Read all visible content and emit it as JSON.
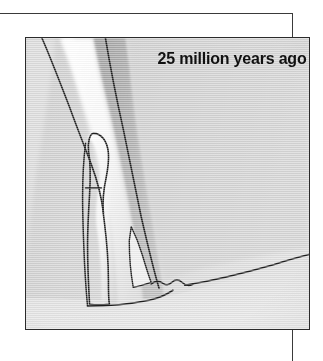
{
  "figure": {
    "caption": "25 million years ago",
    "frame": {
      "rule_color": "#3a3a3a",
      "panel_border_color": "#2b2b2b"
    }
  },
  "map": {
    "type": "shaded-relief-paleogeographic-map",
    "palette": {
      "background_plain": "#d6d6d6",
      "upland_shade": "#a9a9a9",
      "valley_highlight": "#fbfbfb",
      "lowland_light": "#e6e6e6",
      "coastline_ink": "#1e1e1e"
    },
    "features": [
      {
        "name": "rift-valley-highlight",
        "kind": "highlight-band",
        "description": "Bright pale band running from top-centre down to lower-centre-left"
      },
      {
        "name": "western-escarpment-line",
        "kind": "outline",
        "description": "Dark line descending from top-left edge toward the valley floor"
      },
      {
        "name": "eastern-escarpment-line",
        "kind": "outline",
        "description": "Dark line descending from top-centre toward the lower-centre"
      },
      {
        "name": "proto-lake-basin",
        "kind": "closed-outline",
        "description": "Narrow elongated enclosed basin in the centre-left of the panel"
      },
      {
        "name": "southern-shoreline",
        "kind": "outline",
        "description": "Long diagonal line running from the valley mouth to the right edge"
      },
      {
        "name": "location-tick-marker",
        "kind": "tick",
        "description": "Small horizontal tick crossing the basin outline"
      }
    ]
  }
}
